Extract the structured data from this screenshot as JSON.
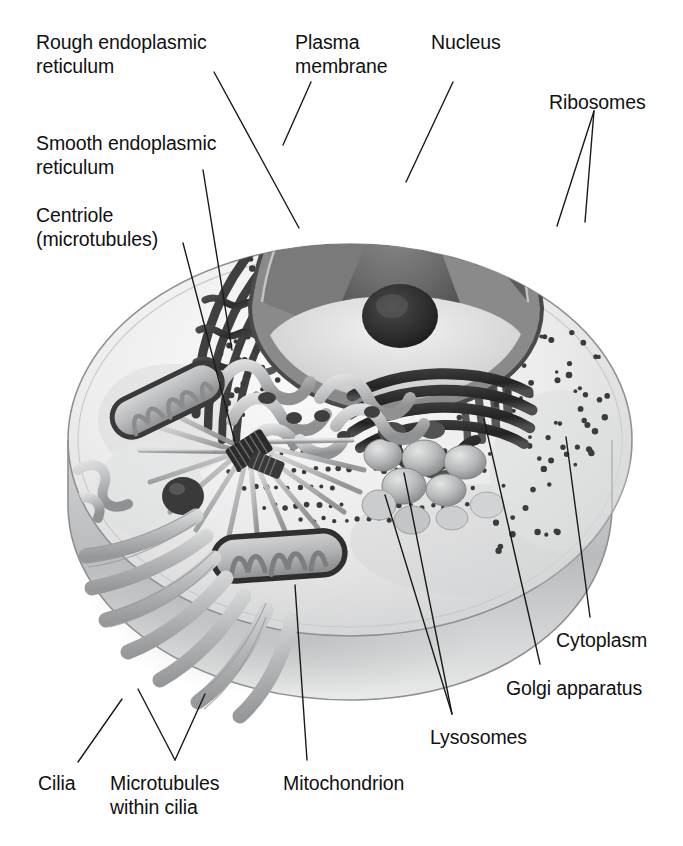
{
  "figure": {
    "background_color": "#ffffff",
    "text_color": "#111111",
    "leader_line_color": "#1a1a1a",
    "style": "grayscale airbrush textbook illustration"
  },
  "labels": [
    {
      "id": "rough-er",
      "text": "Rough endoplasmic\nreticulum",
      "x": 36,
      "y": 30,
      "align": "left"
    },
    {
      "id": "plasma-membrane",
      "text": "Plasma\nmembrane",
      "x": 295,
      "y": 30,
      "align": "left"
    },
    {
      "id": "nucleus",
      "text": "Nucleus",
      "x": 431,
      "y": 30,
      "align": "left"
    },
    {
      "id": "ribosomes",
      "text": "Ribosomes",
      "x": 549,
      "y": 90,
      "align": "left"
    },
    {
      "id": "smooth-er",
      "text": "Smooth endoplasmic\nreticulum",
      "x": 36,
      "y": 131,
      "align": "left"
    },
    {
      "id": "centriole",
      "text": "Centriole\n(microtubules)",
      "x": 36,
      "y": 203,
      "align": "left"
    },
    {
      "id": "cytoplasm",
      "text": "Cytoplasm",
      "x": 556,
      "y": 628,
      "align": "left"
    },
    {
      "id": "golgi",
      "text": "Golgi apparatus",
      "x": 506,
      "y": 676,
      "align": "left"
    },
    {
      "id": "lysosomes",
      "text": "Lysosomes",
      "x": 430,
      "y": 725,
      "align": "left"
    },
    {
      "id": "cilia",
      "text": "Cilia",
      "x": 38,
      "y": 771,
      "align": "left"
    },
    {
      "id": "microtubules",
      "text": "Microtubules\nwithin cilia",
      "x": 110,
      "y": 771,
      "align": "left"
    },
    {
      "id": "mitochondrion",
      "text": "Mitochondrion",
      "x": 283,
      "y": 771,
      "align": "left"
    }
  ],
  "leaders": [
    {
      "id": "rough-er-leader",
      "points": "214,72 299,228"
    },
    {
      "id": "plasma-membrane-leader",
      "points": "311,82 283,145"
    },
    {
      "id": "nucleus-leader",
      "points": "453,82 406,182"
    },
    {
      "id": "ribosomes-leader-a",
      "points": "594,111 557,226"
    },
    {
      "id": "ribosomes-leader-b",
      "points": "594,111 585,222"
    },
    {
      "id": "smooth-er-leader",
      "points": "203,170 232,350"
    },
    {
      "id": "centriole-leader",
      "points": "183,243 236,446"
    },
    {
      "id": "cytoplasm-leader",
      "points": "590,617 566,437"
    },
    {
      "id": "golgi-leader",
      "points": "540,664 484,419"
    },
    {
      "id": "lysosomes-leader-a",
      "points": "452,714 404,473"
    },
    {
      "id": "lysosomes-leader-b",
      "points": "452,714 385,495"
    },
    {
      "id": "cilia-leader",
      "points": "78,762 122,699"
    },
    {
      "id": "microtubules-leader-a",
      "points": "175,760 138,689"
    },
    {
      "id": "microtubules-leader-b",
      "points": "175,760 205,694"
    },
    {
      "id": "mitochondrion-leader",
      "points": "307,760 295,585"
    }
  ],
  "organelles": [
    {
      "name": "plasma-membrane",
      "description": "outer oval boundary of the cell, thin gray rim"
    },
    {
      "name": "cytoplasm",
      "description": "pale gray interior fill of the cell body"
    },
    {
      "name": "nucleus",
      "description": "large cut-away cone in the upper centre"
    },
    {
      "name": "nucleolus",
      "description": "dark round mass inside the nucleus"
    },
    {
      "name": "nuclear-envelope",
      "description": "double membrane ring around the nucleus"
    },
    {
      "name": "rough-endoplasmic-reticulum",
      "description": "dark concentric membrane sheets studded with ribosome dots"
    },
    {
      "name": "ribosomes",
      "description": "small dark dots on the rough ER and free in cytoplasm"
    },
    {
      "name": "smooth-endoplasmic-reticulum",
      "description": "pale tubular network left of centre"
    },
    {
      "name": "golgi-apparatus",
      "description": "stack of curved flattened cisternae, right of centre"
    },
    {
      "name": "lysosomes",
      "description": "round vesicles below the Golgi"
    },
    {
      "name": "mitochondrion-upper",
      "description": "bean-shaped organelle with cristae, upper left"
    },
    {
      "name": "mitochondrion-lower",
      "description": "bean-shaped organelle with cristae, lower centre"
    },
    {
      "name": "centriole",
      "description": "short dark barrel of microtubules at centre-left"
    },
    {
      "name": "microtubules",
      "description": "pale rods radiating from the centriole"
    },
    {
      "name": "cilia",
      "description": "finger-like projections at the lower-left rim"
    }
  ]
}
